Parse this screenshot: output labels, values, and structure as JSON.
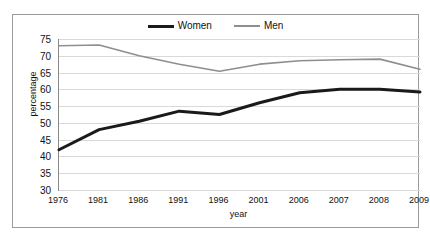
{
  "chart_data": {
    "type": "line",
    "title": "",
    "xlabel": "year",
    "ylabel": "percentage",
    "categories": [
      "1976",
      "1981",
      "1986",
      "1991",
      "1996",
      "2001",
      "2006",
      "2007",
      "2008",
      "2009"
    ],
    "series": [
      {
        "name": "Women",
        "color": "#1a1a1a",
        "width": 3,
        "values": [
          42,
          48,
          50.5,
          53.5,
          52.5,
          56,
          59,
          60,
          60,
          59.2
        ]
      },
      {
        "name": "Men",
        "color": "#8e8e8e",
        "width": 1.6,
        "values": [
          73,
          73.2,
          70,
          67.5,
          65.4,
          67.5,
          68.5,
          68.8,
          69,
          66
        ]
      }
    ],
    "ylim": [
      30,
      75
    ],
    "ytick_step": 5,
    "yticks": [
      "75",
      "70",
      "65",
      "60",
      "55",
      "50",
      "45",
      "40",
      "35",
      "30"
    ],
    "grid": true,
    "legend_position": "top-center"
  },
  "legend": {
    "women_label": "Women",
    "men_label": "Men"
  },
  "axes": {
    "y_title": "percentage",
    "x_title": "year"
  }
}
